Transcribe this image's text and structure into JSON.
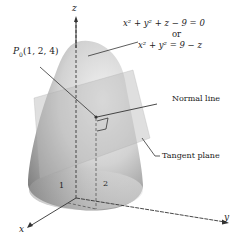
{
  "figure": {
    "axes": {
      "z_label": "z",
      "x_label": "x",
      "y_label": "y",
      "x_tick": "1",
      "y_tick": "2"
    },
    "point_label": {
      "name": "P",
      "subscript": "0",
      "coords": "(1, 2, 4)"
    },
    "equations": {
      "line1": "x² + y² + z − 9 = 0",
      "connector": "or",
      "line2": "x² + y² = 9 − z"
    },
    "annotations": {
      "normal_line": "Normal line",
      "tangent_plane": "Tangent plane"
    },
    "colors": {
      "surface_light": "#e6e6e6",
      "surface_dark": "#8a8a8a",
      "plane": "#c8c8c8",
      "axis": "#333333"
    }
  }
}
